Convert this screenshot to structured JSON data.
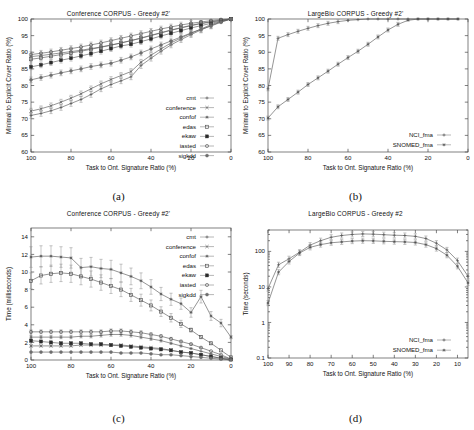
{
  "figure": {
    "captions": {
      "a": "(a)",
      "b": "(b)",
      "c": "(c)",
      "d": "(d)"
    }
  },
  "common": {
    "xlabel": "Task to Ont. Signature Ratio (%)",
    "ratio_ylabel": "Minimal to Explicit Cover Ratio (%)",
    "time_ms_ylabel": "Time (milliseconds)",
    "time_s_ylabel": "Time (seconds)"
  },
  "chart_data": [
    {
      "id": "a",
      "type": "line",
      "title": "Conference CORPUS - Greedy #2'",
      "xlabel": "Task to Ont. Signature Ratio (%)",
      "ylabel": "Minimal to Explicit Cover Ratio (%)",
      "xlim": [
        100,
        0
      ],
      "ylim": [
        60,
        100
      ],
      "xticks": [
        100,
        80,
        60,
        40,
        20,
        0
      ],
      "yticks": [
        60,
        65,
        70,
        75,
        80,
        85,
        90,
        95,
        100
      ],
      "x_reversed": true,
      "grid": false,
      "legend_position": "bottom-right",
      "errorbars": true,
      "x": [
        100,
        95,
        90,
        85,
        80,
        75,
        70,
        65,
        60,
        55,
        50,
        45,
        40,
        35,
        30,
        25,
        20,
        15,
        10,
        5,
        0
      ],
      "series": [
        {
          "name": "cmt",
          "marker": "plus",
          "values": [
            71.0,
            71.6,
            72.4,
            73.4,
            74.6,
            75.8,
            77.3,
            79.0,
            80.3,
            81.4,
            82.6,
            86.0,
            88.2,
            90.3,
            92.2,
            93.8,
            95.3,
            96.7,
            98.0,
            99.2,
            100.0
          ]
        },
        {
          "name": "conference",
          "marker": "cross",
          "values": [
            72.3,
            73.0,
            73.9,
            75.0,
            76.2,
            77.5,
            79.0,
            80.5,
            81.8,
            83.0,
            84.2,
            87.0,
            89.1,
            91.0,
            92.8,
            94.3,
            95.7,
            97.0,
            98.3,
            99.3,
            100.0
          ]
        },
        {
          "name": "confof",
          "marker": "star",
          "values": [
            88.7,
            89.0,
            89.4,
            89.8,
            90.2,
            90.6,
            91.1,
            91.6,
            92.2,
            92.8,
            93.5,
            94.2,
            95.0,
            95.8,
            96.6,
            97.3,
            98.0,
            98.6,
            99.1,
            99.6,
            100.0
          ]
        },
        {
          "name": "edas",
          "marker": "opensquare",
          "values": [
            87.9,
            88.3,
            88.8,
            89.3,
            89.8,
            90.3,
            90.9,
            91.5,
            92.1,
            92.8,
            93.5,
            94.3,
            95.1,
            95.9,
            96.7,
            97.4,
            98.1,
            98.7,
            99.2,
            99.6,
            100.0
          ]
        },
        {
          "name": "ekaw",
          "marker": "filledsquare",
          "values": [
            85.6,
            86.2,
            86.9,
            87.6,
            88.2,
            88.9,
            89.6,
            90.3,
            91.1,
            91.9,
            92.4,
            93.2,
            94.0,
            94.9,
            95.7,
            96.5,
            97.3,
            98.0,
            98.7,
            99.4,
            100.0
          ]
        },
        {
          "name": "iasted",
          "marker": "opencircle",
          "values": [
            89.3,
            89.7,
            90.1,
            90.6,
            91.1,
            91.6,
            92.2,
            92.8,
            93.5,
            94.2,
            94.9,
            95.6,
            96.3,
            97.0,
            97.6,
            98.2,
            98.7,
            99.1,
            99.5,
            99.8,
            100.0
          ]
        },
        {
          "name": "sigkdd",
          "marker": "filledcircle",
          "values": [
            81.7,
            82.4,
            83.1,
            83.8,
            84.4,
            85.0,
            85.7,
            86.2,
            86.7,
            87.6,
            88.6,
            89.8,
            91.0,
            92.2,
            93.4,
            94.6,
            95.8,
            96.9,
            97.9,
            99.0,
            100.0
          ]
        }
      ]
    },
    {
      "id": "b",
      "type": "line",
      "title": "LargeBio CORPUS - Greedy #2'",
      "xlabel": "Task to Ont. Signature Ratio (%)",
      "ylabel": "Minimal to Explicit Cover Ratio (%)",
      "xlim": [
        100,
        0
      ],
      "ylim": [
        60,
        100
      ],
      "xticks": [
        100,
        80,
        60,
        40,
        20,
        0
      ],
      "yticks": [
        60,
        65,
        70,
        75,
        80,
        85,
        90,
        95,
        100
      ],
      "x_reversed": true,
      "grid": false,
      "legend_position": "bottom-right",
      "errorbars": true,
      "x": [
        100,
        95,
        90,
        85,
        80,
        75,
        70,
        65,
        60,
        55,
        50,
        45,
        40,
        35,
        30,
        25,
        20,
        15,
        10,
        5
      ],
      "series": [
        {
          "name": "NCI_fma",
          "marker": "plus",
          "values": [
            79.0,
            94.2,
            95.3,
            96.3,
            97.2,
            98.0,
            98.7,
            99.2,
            99.6,
            99.8,
            100.0,
            100.0,
            100.0,
            100.0,
            100.0,
            100.0,
            100.0,
            100.0,
            100.0,
            100.0
          ]
        },
        {
          "name": "SNOMED_fma",
          "marker": "star",
          "values": [
            70.2,
            73.6,
            75.8,
            78.0,
            80.3,
            82.3,
            84.3,
            86.4,
            88.4,
            90.3,
            92.4,
            94.6,
            96.7,
            98.4,
            99.6,
            100.0,
            100.0,
            100.0,
            100.0,
            100.0
          ]
        }
      ]
    },
    {
      "id": "c",
      "type": "line",
      "title": "Conference CORPUS - Greedy #2'",
      "xlabel": "Task to Ont. Signature Ratio (%)",
      "ylabel": "Time (milliseconds)",
      "xlim": [
        100,
        0
      ],
      "ylim": [
        0,
        15
      ],
      "xticks": [
        100,
        80,
        60,
        40,
        20,
        0
      ],
      "yticks": [
        0,
        2,
        4,
        6,
        8,
        10,
        12,
        14
      ],
      "x_reversed": true,
      "grid": false,
      "legend_position": "top-right",
      "errorbars": true,
      "x": [
        100,
        95,
        90,
        85,
        80,
        75,
        70,
        65,
        60,
        55,
        50,
        45,
        40,
        35,
        30,
        25,
        20,
        15,
        10,
        5,
        0
      ],
      "series": [
        {
          "name": "cmt",
          "marker": "plus",
          "values": [
            2.6,
            2.6,
            2.6,
            2.6,
            2.6,
            2.7,
            2.7,
            2.8,
            2.9,
            2.9,
            2.8,
            2.6,
            2.4,
            2.2,
            1.9,
            1.6,
            1.3,
            1.0,
            0.7,
            0.4,
            0.1
          ]
        },
        {
          "name": "conference",
          "marker": "cross",
          "values": [
            1.6,
            1.6,
            1.6,
            1.6,
            1.6,
            1.7,
            1.7,
            1.7,
            1.7,
            1.7,
            1.6,
            1.5,
            1.4,
            1.3,
            1.1,
            0.9,
            0.8,
            0.6,
            0.4,
            0.2,
            0.05
          ]
        },
        {
          "name": "confof",
          "marker": "star",
          "values": [
            11.7,
            11.8,
            11.8,
            11.7,
            11.6,
            10.5,
            10.6,
            10.4,
            10.3,
            9.9,
            9.5,
            9.0,
            8.3,
            7.5,
            6.9,
            6.4,
            5.4,
            7.2,
            5.0,
            4.2,
            2.6
          ]
        },
        {
          "name": "edas",
          "marker": "opensquare",
          "values": [
            9.0,
            9.6,
            9.8,
            9.9,
            9.8,
            9.5,
            9.2,
            8.8,
            8.4,
            8.0,
            7.4,
            6.8,
            6.2,
            5.5,
            4.8,
            4.1,
            3.4,
            2.6,
            1.9,
            1.1,
            0.3
          ]
        },
        {
          "name": "ekaw",
          "marker": "filledsquare",
          "values": [
            2.2,
            2.1,
            2.0,
            1.9,
            1.9,
            1.9,
            1.8,
            1.8,
            1.7,
            1.6,
            1.5,
            1.4,
            1.3,
            1.2,
            1.1,
            0.9,
            0.8,
            0.6,
            0.4,
            0.2,
            0.05
          ]
        },
        {
          "name": "iasted",
          "marker": "opencircle",
          "values": [
            3.2,
            3.2,
            3.2,
            3.2,
            3.2,
            3.2,
            3.2,
            3.2,
            3.3,
            3.3,
            3.2,
            3.1,
            2.9,
            2.7,
            2.4,
            2.1,
            1.8,
            1.4,
            1.0,
            0.6,
            0.1
          ]
        },
        {
          "name": "sigkdd",
          "marker": "filledcircle",
          "values": [
            0.9,
            0.9,
            0.9,
            0.9,
            0.9,
            0.9,
            0.9,
            0.9,
            0.9,
            0.8,
            0.8,
            0.8,
            0.7,
            0.6,
            0.6,
            0.5,
            0.4,
            0.3,
            0.2,
            0.1,
            0.02
          ]
        }
      ]
    },
    {
      "id": "d",
      "type": "line",
      "title": "LargeBio CORPUS - Greedy #2",
      "xlabel": "Task to Ont. Signature Ratio (%)",
      "ylabel": "Time (seconds)",
      "xlim": [
        100,
        5
      ],
      "ylim": [
        0.1,
        400
      ],
      "yscale": "log",
      "xticks": [
        100,
        90,
        80,
        70,
        60,
        50,
        40,
        30,
        20,
        10
      ],
      "yticks": [
        0.1,
        1,
        10,
        100
      ],
      "x_reversed": true,
      "grid": false,
      "legend_position": "bottom-right",
      "errorbars": true,
      "x": [
        100,
        95,
        90,
        85,
        80,
        75,
        70,
        65,
        60,
        55,
        50,
        45,
        40,
        35,
        30,
        25,
        20,
        15,
        10,
        5
      ],
      "series": [
        {
          "name": "NCI_fma",
          "marker": "plus",
          "values": [
            9.0,
            42.0,
            62.0,
            95.0,
            150.0,
            200.0,
            250.0,
            280.0,
            300.0,
            310.0,
            305.0,
            295.0,
            285.0,
            280.0,
            265.0,
            230.0,
            170.0,
            110.0,
            55.0,
            20.0
          ]
        },
        {
          "name": "SNOMED_fma",
          "marker": "star",
          "values": [
            3.5,
            26.0,
            52.0,
            90.0,
            130.0,
            155.0,
            175.0,
            185.0,
            195.0,
            200.0,
            198.0,
            192.0,
            188.0,
            185.0,
            178.0,
            155.0,
            120.0,
            78.0,
            38.0,
            13.0
          ]
        }
      ]
    }
  ]
}
